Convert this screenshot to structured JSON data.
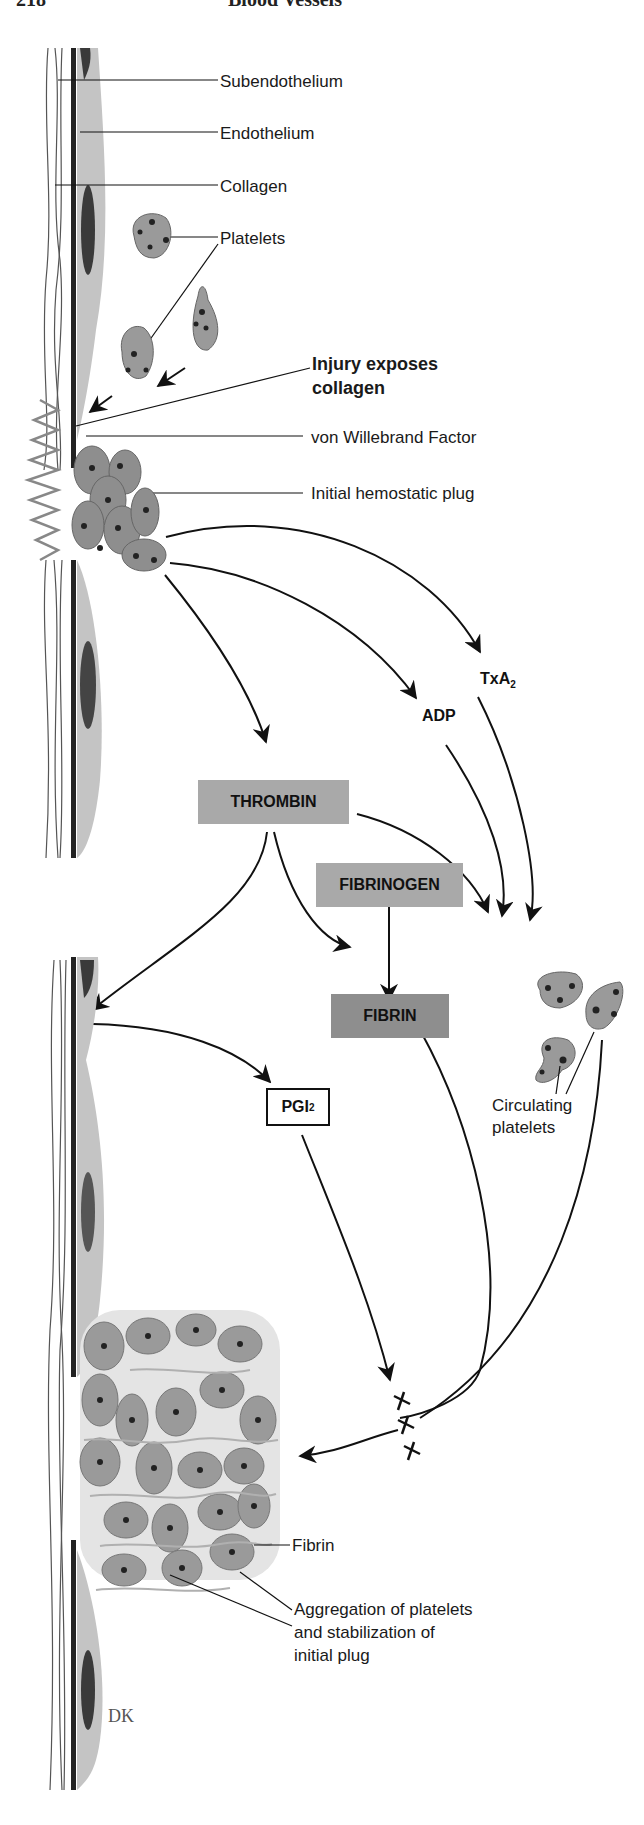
{
  "page_header": {
    "page_number": "218",
    "running_title": "Blood Vessels"
  },
  "labels": {
    "subendothelium": "Subendothelium",
    "endothelium": "Endothelium",
    "collagen": "Collagen",
    "platelets": "Platelets",
    "injury_line1": "Injury exposes",
    "injury_line2": "collagen",
    "vwf": "von Willebrand Factor",
    "initial_plug": "Initial hemostatic plug",
    "circulating_line1": "Circulating",
    "circulating_line2": "platelets",
    "fibrin_label": "Fibrin",
    "aggregation_line1": "Aggregation of platelets",
    "aggregation_line2": "and stabilization of",
    "aggregation_line3": "initial plug",
    "signature": "DK"
  },
  "mediators": {
    "adp": "ADP",
    "txa2_base": "TxA",
    "txa2_sub": "2",
    "thrombin": "THROMBIN",
    "fibrinogen": "FIBRINOGEN",
    "fibrin": "FIBRIN",
    "pgi2_base": "PGI",
    "pgi2_sub": "2"
  },
  "inhibition_mark": "x x x",
  "colors": {
    "box_fill": "#a9a9a9",
    "fibrin_box_fill": "#8e8e8e",
    "platelet_fill": "#9a9a9a",
    "endothelium_fill": "#c4c4c4",
    "nucleus_fill": "#3a3a3a",
    "line": "#111111"
  }
}
